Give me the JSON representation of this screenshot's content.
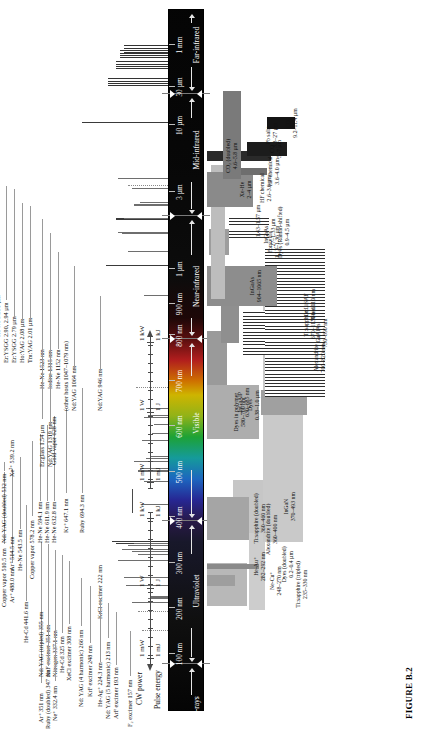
{
  "figure": {
    "caption": "FIGURE B.2"
  },
  "spectrum": {
    "regions": [
      {
        "name": "X-rays",
        "label_pos": 0.5
      },
      {
        "name": "Ultraviolet",
        "label_pos": 17.0
      },
      {
        "name": "Visible",
        "label_pos": 41.0
      },
      {
        "name": "Near-infrared",
        "label_pos": 60.5
      },
      {
        "name": "Mid-infrared",
        "label_pos": 80.0
      },
      {
        "name": "Far-infrared",
        "label_pos": 95.0
      }
    ],
    "ticks": [
      {
        "label": "100 nm",
        "pos": 8.0
      },
      {
        "label": "200 nm",
        "pos": 14.5
      },
      {
        "label": "300 nm",
        "pos": 21.0
      },
      {
        "label": "400 nm",
        "pos": 27.5
      },
      {
        "label": "500 nm",
        "pos": 34.0
      },
      {
        "label": "600 nm",
        "pos": 40.5
      },
      {
        "label": "700 nm",
        "pos": 47.0
      },
      {
        "label": "800 nm",
        "pos": 53.5
      },
      {
        "label": "900 nm",
        "pos": 58.0
      },
      {
        "label": "1 µm",
        "pos": 63.0
      },
      {
        "label": "3 µm",
        "pos": 74.0
      },
      {
        "label": "10 µm",
        "pos": 83.5
      },
      {
        "label": "30 µm",
        "pos": 89.0
      },
      {
        "label": "1 mm",
        "pos": 95.0
      }
    ]
  },
  "chart_data": {
    "type": "bar",
    "xlabel": "Wavelength",
    "ylabel": "CW power / Pulse energy",
    "discrete_lines": [
      {
        "name": "F₂ excimer 157 nm",
        "pos": 11.4,
        "h": 26,
        "style": "dot",
        "lab_x": 2,
        "lab_y": 126,
        "align": "l",
        "callout": 0
      },
      {
        "name": "ArF excimer 193 nm",
        "pos": 14.2,
        "h": 30,
        "style": "dot",
        "lab_x": 10,
        "lab_y": 112,
        "align": "l",
        "callout": 0
      },
      {
        "name": "Nd: YAG (5 harmonic) 213 nm",
        "pos": 15.4,
        "h": 36,
        "style": "line",
        "lab_x": 10,
        "lab_y": 104,
        "align": "l",
        "callout": 0
      },
      {
        "name": "KrCl excimer 222 nm",
        "pos": 16.0,
        "h": 20,
        "style": "line",
        "lab_x": 110,
        "lab_y": 96,
        "align": "l",
        "callout": 0
      },
      {
        "name": "He-Ag⁺ 224.3 nm",
        "pos": 16.2,
        "h": 18,
        "style": "line",
        "lab_x": 22,
        "lab_y": 96,
        "align": "l",
        "callout": 0
      },
      {
        "name": "KrF excimer 248 nm",
        "pos": 17.8,
        "h": 42,
        "style": "line",
        "lab_x": 32,
        "lab_y": 86,
        "align": "l",
        "callout": 0
      },
      {
        "name": "Nd: YAG (4 harmonic) 266 nm",
        "pos": 19.0,
        "h": 44,
        "style": "line",
        "lab_x": 22,
        "lab_y": 77,
        "align": "l",
        "callout": 0
      },
      {
        "name": "XeCl excimer 308 nm",
        "pos": 21.4,
        "h": 50,
        "style": "line",
        "lab_x": 48,
        "lab_y": 65,
        "align": "l",
        "callout": 0
      },
      {
        "name": "He-Cd 325 nm",
        "pos": 22.3,
        "h": 30,
        "style": "line",
        "lab_x": 56,
        "lab_y": 58,
        "align": "l",
        "callout": 0
      },
      {
        "name": "Nitrogen 337.1 nm",
        "pos": 23.0,
        "h": 46,
        "style": "line",
        "lab_x": 52,
        "lab_y": 51,
        "align": "l",
        "callout": 0
      },
      {
        "name": "Ne⁺ 332.4 nm",
        "pos": 22.7,
        "h": 36,
        "style": "line",
        "lab_x": 8,
        "lab_y": 51,
        "align": "l",
        "callout": 0
      },
      {
        "name": "XeF excimer 351 nm",
        "pos": 23.8,
        "h": 52,
        "style": "line",
        "lab_x": 52,
        "lab_y": 44,
        "align": "l",
        "callout": 0
      },
      {
        "name": "Ruby (doubled) 347 nm",
        "pos": 23.6,
        "h": 40,
        "style": "line",
        "lab_x": 0,
        "lab_y": 44,
        "align": "l",
        "callout": 0
      },
      {
        "name": "Ar⁺ 351 nm",
        "pos": 23.9,
        "h": 34,
        "style": "line",
        "lab_x": 6,
        "lab_y": 37,
        "align": "l",
        "callout": 0
      },
      {
        "name": "Nd: YAG (tripled) 355 nm",
        "pos": 24.1,
        "h": 56,
        "style": "line",
        "lab_x": 52,
        "lab_y": 37,
        "align": "l",
        "callout": 0
      },
      {
        "name": "He-Cd 441.6 nm",
        "pos": 29.4,
        "h": 26,
        "style": "line",
        "lab_x": 86,
        "lab_y": 22,
        "align": "l",
        "callout": 0
      },
      {
        "name": "Ar⁺ 488.0 nm",
        "pos": 32.7,
        "h": 24,
        "style": "line",
        "lab_x": 126,
        "lab_y": 8,
        "align": "l",
        "callout": 0
      },
      {
        "name": "Copper vapor 510.5 nm",
        "pos": 34.2,
        "h": 30,
        "style": "line",
        "lab_x": 122,
        "lab_y": 0,
        "align": "l",
        "callout": 0
      },
      {
        "name": "Nd: YAG (doubled) 532 nm",
        "pos": 35.6,
        "h": 34,
        "style": "line",
        "lab_x": 186,
        "lab_y": 0,
        "align": "l",
        "callout": 0
      },
      {
        "name": "Ar⁺ 514.5 nm",
        "pos": 34.5,
        "h": 28,
        "style": "line",
        "lab_x": 158,
        "lab_y": 8,
        "align": "l",
        "callout": 0
      },
      {
        "name": "Xe²⁺ 539.2 nm",
        "pos": 36.0,
        "h": 22,
        "style": "line",
        "lab_x": 252,
        "lab_y": 8,
        "align": "l",
        "callout": 0
      },
      {
        "name": "He-Ne 543.5 nm",
        "pos": 36.3,
        "h": 18,
        "style": "line",
        "lab_x": 158,
        "lab_y": 16,
        "align": "l",
        "callout": 0
      },
      {
        "name": "Copper vapor 578.2 nm",
        "pos": 38.6,
        "h": 26,
        "style": "line",
        "lab_x": 150,
        "lab_y": 28,
        "align": "l",
        "callout": 0
      },
      {
        "name": "He-Ne 594.1 nm",
        "pos": 39.6,
        "h": 16,
        "style": "line",
        "lab_x": 186,
        "lab_y": 36,
        "align": "l",
        "callout": 0
      },
      {
        "name": "He-Ne 611.9 nm",
        "pos": 40.8,
        "h": 14,
        "style": "line",
        "lab_x": 186,
        "lab_y": 43,
        "align": "l",
        "callout": 0
      },
      {
        "name": "He-Ne 632.8 nm",
        "pos": 42.1,
        "h": 20,
        "style": "line",
        "lab_x": 186,
        "lab_y": 50,
        "align": "l",
        "callout": 0
      },
      {
        "name": "Gold vapor 628 nm",
        "pos": 41.8,
        "h": 24,
        "style": "line",
        "lab_x": 264,
        "lab_y": 50,
        "align": "l",
        "callout": 0
      },
      {
        "name": "Kr⁺ 647.1 nm",
        "pos": 43.1,
        "h": 22,
        "style": "line",
        "lab_x": 196,
        "lab_y": 62,
        "align": "l",
        "callout": 0
      },
      {
        "name": "Ruby 694.3 nm",
        "pos": 46.2,
        "h": 32,
        "style": "dot",
        "lab_x": 196,
        "lab_y": 78,
        "align": "l",
        "callout": 0
      },
      {
        "name": "Nd:YAG 946 nm",
        "pos": 59.3,
        "h": 24,
        "style": "line",
        "lab_x": 318,
        "lab_y": 96,
        "align": "l",
        "callout": 0
      },
      {
        "name": "Nd:YAG 1064 nm",
        "pos": 63.6,
        "h": 62,
        "style": "line",
        "lab_x": 318,
        "lab_y": 70,
        "align": "l",
        "callout": 0
      },
      {
        "name": "(other hosts 1047–1079 nm)",
        "pos": 63.6,
        "h": 0,
        "style": "none",
        "lab_x": 318,
        "lab_y": 62,
        "align": "l",
        "callout": 0
      },
      {
        "name": "He-Ne 1152 nm",
        "pos": 65.5,
        "h": 40,
        "style": "line",
        "lab_x": 340,
        "lab_y": 54,
        "align": "l",
        "callout": 0
      },
      {
        "name": "Iodine 1315 nm",
        "pos": 68.2,
        "h": 46,
        "style": "line",
        "lab_x": 340,
        "lab_y": 46,
        "align": "l",
        "callout": 0
      },
      {
        "name": "Nd:YAG 1319 nm",
        "pos": 68.3,
        "h": 50,
        "style": "line",
        "lab_x": 262,
        "lab_y": 46,
        "align": "l",
        "callout": 0
      },
      {
        "name": "He-Ne 1523 nm",
        "pos": 70.2,
        "h": 52,
        "style": "line",
        "lab_x": 340,
        "lab_y": 38,
        "align": "l",
        "callout": 0
      },
      {
        "name": "Er:glass 1.54 µm",
        "pos": 70.3,
        "h": 44,
        "style": "line",
        "lab_x": 262,
        "lab_y": 38,
        "align": "l",
        "callout": 0
      },
      {
        "name": "Tm:YAG 2.01 µm",
        "pos": 72.2,
        "h": 34,
        "style": "line",
        "lab_x": 366,
        "lab_y": 26,
        "align": "l",
        "callout": 0
      },
      {
        "name": "Ho:YAG 2.08 µm",
        "pos": 72.5,
        "h": 28,
        "style": "line",
        "lab_x": 366,
        "lab_y": 18,
        "align": "l",
        "callout": 0
      },
      {
        "name": "Er:YSGG 2.79 µm",
        "pos": 74.6,
        "h": 36,
        "style": "line",
        "lab_x": 366,
        "lab_y": 10,
        "align": "l",
        "callout": 0
      },
      {
        "name": "Er:YSGG 2.90, 2.94 µm",
        "pos": 75.0,
        "h": 40,
        "style": "dot",
        "lab_x": 366,
        "lab_y": 2,
        "align": "l",
        "callout": 0
      },
      {
        "name": "He-Ne 3.391 µm",
        "pos": 76.0,
        "h": 50,
        "style": "line",
        "lab_x": 392,
        "lab_y": -6,
        "align": "l",
        "callout": 0
      },
      {
        "name": "CO₂ 10.6 µm",
        "pos": 84.0,
        "h": 86,
        "style": "line",
        "lab_x": 452,
        "lab_y": -34,
        "align": "l",
        "callout": 0
      },
      {
        "name": "Methanol 37.9 70.5 96.5 118 µm",
        "pos": 89.8,
        "h": 60,
        "style": "hatch",
        "lab_x": 520,
        "lab_y": -52,
        "align": "l",
        "callout": 0
      },
      {
        "name": "Methylamine 147.8 µm",
        "pos": 92.3,
        "h": 52,
        "style": "hatch",
        "lab_x": 520,
        "lab_y": -60,
        "align": "l",
        "callout": 0
      },
      {
        "name": "Methyl fluoride 486 µm",
        "pos": 93.8,
        "h": 48,
        "style": "hatch",
        "lab_x": 520,
        "lab_y": -68,
        "align": "l",
        "callout": 0
      },
      {
        "name": "Methanol 571, 699 µm",
        "pos": 94.6,
        "h": 44,
        "style": "hatch",
        "lab_x": 520,
        "lab_y": -76,
        "align": "l",
        "callout": 0
      }
    ],
    "tunable_blocks": [
      {
        "name": "Ti:sapphire (tripled)",
        "range": "235–330 nm",
        "x0": 15.0,
        "x1": 21.2,
        "y": 4,
        "h": 40,
        "fill": "#b8b8b8",
        "lab_y": 92
      },
      {
        "name": "Dyes (doubled)",
        "range": "0.2–0.4 µm",
        "x0": 14.4,
        "x1": 27.5,
        "y": 46,
        "h": 16,
        "fill": "#cdcdcd",
        "lab_y": 78
      },
      {
        "name": "Ne-Cu⁺",
        "range": "248–270 nm",
        "x0": 17.8,
        "x1": 19.4,
        "y": 4,
        "h": 28,
        "fill": "#9e9e9e",
        "lab_y": 66
      },
      {
        "name": "He-Au⁺",
        "range": "282–292 nm",
        "x0": 20.3,
        "x1": 21.0,
        "y": 4,
        "h": 52,
        "fill": "#8a8a8a",
        "lab_y": 50
      },
      {
        "name": "Alexandrite (doubled)",
        "range": "360–400 nm",
        "x0": 24.4,
        "x1": 27.5,
        "y": 4,
        "h": 24,
        "fill": "#b2b2b2",
        "lab_y": 62
      },
      {
        "name": "InGaN",
        "range": "370–493 nm",
        "x0": 25.4,
        "x1": 33.0,
        "y": 30,
        "h": 30,
        "fill": "#c6c6c6",
        "lab_y": 80
      },
      {
        "name": "Ti:sapphire (doubled)",
        "range": "360–460 nm",
        "x0": 24.4,
        "x1": 30.6,
        "y": 4,
        "h": 42,
        "fill": "#a5a5a5",
        "lab_y": 50
      },
      {
        "name": "Dyes",
        "range": "0.38–1.0 µm",
        "x0": 24.2,
        "x1": 63.2,
        "y": 60,
        "h": 40,
        "fill": "#c9c9c9",
        "lab_y": 44
      },
      {
        "name": "Dyes in polymer",
        "range": "580–700 nm",
        "x0": 38.8,
        "x1": 46.6,
        "y": 4,
        "h": 52,
        "fill": "#adadad",
        "lab_y": 30
      },
      {
        "name": "InGaAlP",
        "range": "630–685 nm",
        "x0": 42.3,
        "x1": 45.9,
        "y": 58,
        "h": 46,
        "fill": "#a0a0a0",
        "lab_y": 34
      },
      {
        "name": "Alexandrite",
        "range": "700–820 nm",
        "x0": 46.6,
        "x1": 54.3,
        "y": 4,
        "h": 20,
        "fill": "#9a9a9a",
        "lab_y": 110
      },
      {
        "name": "Cr:LiSAF",
        "range": "780–1010 nm",
        "x0": 52.6,
        "x1": 63.4,
        "y": 18,
        "h": 18,
        "fill": "#8f8f8f",
        "lab_y": 100
      },
      {
        "name": "GaAlAs",
        "range": "750–890 nm",
        "x0": 50.8,
        "x1": 57.2,
        "y": 40,
        "h": 54,
        "fill": "#ffffff",
        "lab_y": 112,
        "hatch": true
      },
      {
        "name": "Ti:sapphire",
        "range": "670–1130 nm",
        "x0": 44.8,
        "x1": 66.0,
        "y": 62,
        "h": 60,
        "fill": "#ffffff",
        "lab_y": 100,
        "hatch": true
      },
      {
        "name": "InGaAs",
        "range": "904–1065 nm",
        "x0": 57.8,
        "x1": 63.6,
        "y": 4,
        "h": 70,
        "fill": "#8d8d8d",
        "lab_y": 46
      },
      {
        "name": "InGaAs",
        "range": "1.27–1.33 µm",
        "x0": 67.5,
        "x1": 68.6,
        "y": 26,
        "h": 40,
        "fill": "#ffffff",
        "lab_y": 60,
        "hatch": true
      },
      {
        "name": "",
        "range": "1.43–1.57 µm",
        "x0": 69.4,
        "x1": 70.6,
        "y": 26,
        "h": 40,
        "fill": "#ffffff",
        "lab_y": 52,
        "hatch": true
      },
      {
        "name": "Forsterite",
        "range": "1.13–1.36 µm",
        "x0": 65.2,
        "x1": 68.8,
        "y": 6,
        "h": 20,
        "fill": "#9d9d9d",
        "lab_y": 64
      },
      {
        "name": "HF chemical",
        "range": "2.6–3.0 µm",
        "x0": 74.0,
        "x1": 75.4,
        "y": 6,
        "h": 30,
        "fill": "#7e7e7e",
        "lab_y": 56
      },
      {
        "name": "Dyes (Raman-shifted)",
        "range": "0.9–4.5 µm",
        "x0": 58.8,
        "x1": 78.0,
        "y": 8,
        "h": 14,
        "fill": "#bdbdbd",
        "lab_y": 74
      },
      {
        "name": "Xe-He",
        "range": "2–4 µm",
        "x0": 72.0,
        "x1": 77.0,
        "y": 4,
        "h": 46,
        "fill": "#8a8a8a",
        "lab_y": 36
      },
      {
        "name": "HF chemical",
        "range": "3.6–4.0 µm",
        "x0": 76.6,
        "x1": 77.6,
        "y": 30,
        "h": 34,
        "fill": "#6e6e6e",
        "lab_y": 64
      },
      {
        "name": "CO₂ (doubled)",
        "range": "4.6–5.8 µm",
        "x0": 78.6,
        "x1": 80.0,
        "y": 4,
        "h": 64,
        "fill": "#2a2a2a",
        "lab_y": 22
      },
      {
        "name": "CO",
        "range": "5–7 µm",
        "x0": 79.3,
        "x1": 81.3,
        "y": 44,
        "h": 40,
        "fill": "#1c1c1c",
        "lab_y": 66
      },
      {
        "name": "CO₂",
        "range": "9.2–11.4 µm",
        "x0": 83.2,
        "x1": 84.8,
        "y": 64,
        "h": 28,
        "fill": "#141414",
        "lab_y": 82
      },
      {
        "name": "Pb salts",
        "range": "3.3–27 µm",
        "x0": 76.0,
        "x1": 88.5,
        "y": 20,
        "h": 18,
        "fill": "#7a7a7a",
        "lab_y": 62
      }
    ],
    "power_axis": {
      "cw_label": "CW power",
      "pulse_label": "Pulse energy",
      "cw_ticks": [
        "1 kW",
        "1 W",
        "1 mW",
        "1 mW",
        "1 W",
        "1 kW"
      ],
      "pulse_ticks": [
        "1 kJ",
        "1 J",
        "1 mJ",
        "1 mJ",
        "1 J",
        "1 kJ"
      ]
    }
  }
}
